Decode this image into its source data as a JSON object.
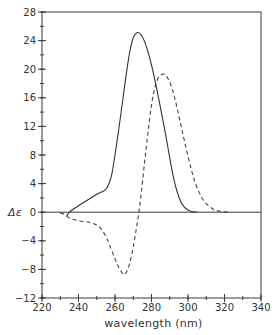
{
  "chart_data": {
    "type": "line",
    "title": "",
    "xlabel": "wavelength  (nm)",
    "ylabel": "Δε",
    "xlim": [
      220,
      340
    ],
    "ylim": [
      -12,
      28
    ],
    "x_ticks": [
      220,
      240,
      260,
      280,
      300,
      320,
      340
    ],
    "x_tick_labels": [
      "220",
      "240",
      "260",
      "280",
      "300",
      "320",
      "340"
    ],
    "x_minor_step": 10,
    "y_ticks": [
      -12,
      -8,
      -4,
      0,
      4,
      8,
      12,
      16,
      20,
      24,
      28
    ],
    "y_tick_labels": [
      "-12",
      "-8",
      "-4",
      "0",
      "4",
      "8",
      "12",
      "16",
      "20",
      "24",
      "28"
    ],
    "y_minor_step": 2,
    "grid": false,
    "zero_line": true,
    "legend": null,
    "series": [
      {
        "name": "solid",
        "style": "solid",
        "color": "#333333",
        "x": [
          233.5,
          235,
          240,
          245,
          250,
          254,
          256,
          258,
          260,
          262,
          264,
          266,
          268,
          270,
          272,
          274,
          276,
          278,
          280,
          282,
          284,
          286,
          288,
          290,
          292,
          294,
          296,
          298,
          300,
          302,
          305
        ],
        "values": [
          -0.6,
          0,
          0.9,
          1.7,
          2.5,
          3.0,
          3.6,
          5.0,
          8.0,
          11.5,
          15.2,
          19.0,
          22.3,
          24.4,
          25.1,
          24.9,
          24.0,
          22.5,
          20.6,
          18.3,
          15.8,
          13.2,
          10.5,
          7.6,
          4.9,
          2.9,
          1.5,
          0.7,
          0.3,
          0.1,
          0
        ]
      },
      {
        "name": "dashed",
        "style": "dashed",
        "color": "#444444",
        "x": [
          230,
          232,
          235,
          240,
          246,
          250,
          252,
          255,
          257,
          260,
          262,
          264,
          265,
          266,
          268,
          270,
          272,
          274,
          276,
          278,
          280,
          282,
          284,
          286,
          287,
          288,
          290,
          292,
          294,
          296,
          298,
          300,
          302,
          304,
          307,
          310,
          314,
          318,
          322
        ],
        "values": [
          -0.1,
          -0.3,
          -0.8,
          -1.2,
          -1.4,
          -1.8,
          -2.2,
          -3.4,
          -4.6,
          -6.5,
          -7.7,
          -8.5,
          -8.7,
          -8.5,
          -7.2,
          -4.8,
          -1.8,
          1.8,
          6.5,
          11.0,
          15.0,
          17.6,
          18.9,
          19.3,
          19.3,
          19.1,
          18.2,
          16.7,
          14.6,
          12.3,
          10.0,
          7.8,
          5.8,
          4.1,
          2.3,
          1.2,
          0.4,
          0.1,
          0
        ]
      }
    ]
  }
}
